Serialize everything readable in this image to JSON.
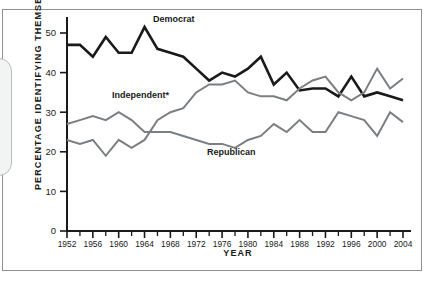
{
  "figure": {
    "ylabel": "PERCENTAGE IDENTIFYING THEMSELVES AS . . .",
    "xlabel": "YEAR"
  },
  "labels": {
    "democrat": "Democrat",
    "independent": "Independent*",
    "republican": "Republican"
  },
  "colors": {
    "democrat": "#1a1a1a",
    "independent": "#7b7f82",
    "republican": "#7b7f82",
    "axis": "#1a1a1a",
    "frame": "#8e9295"
  },
  "chart_data": {
    "type": "line",
    "title": "",
    "xlabel": "YEAR",
    "ylabel": "PERCENTAGE IDENTIFYING THEMSELVES AS . . .",
    "xlim": [
      1952,
      2004
    ],
    "ylim": [
      0,
      53
    ],
    "grid": false,
    "legend": "inline-labels",
    "x": [
      1952,
      1954,
      1956,
      1958,
      1960,
      1962,
      1964,
      1966,
      1968,
      1970,
      1972,
      1974,
      1976,
      1978,
      1980,
      1982,
      1984,
      1986,
      1988,
      1990,
      1992,
      1994,
      1996,
      1998,
      2000,
      2002,
      2004
    ],
    "xticks_major": [
      1952,
      1956,
      1960,
      1964,
      1968,
      1972,
      1976,
      1980,
      1984,
      1988,
      1992,
      1996,
      2000,
      2004
    ],
    "xticks_minor": [
      1954,
      1958,
      1962,
      1966,
      1970,
      1974,
      1978,
      1982,
      1986,
      1990,
      1994,
      1998,
      2002
    ],
    "yticks": [
      0,
      10,
      20,
      30,
      40,
      50
    ],
    "series": [
      {
        "name": "Democrat",
        "color": "#1a1a1a",
        "values": [
          47,
          47,
          44,
          49,
          45,
          45,
          51.5,
          46,
          45,
          44,
          41,
          38,
          40,
          39,
          41,
          44,
          37,
          40,
          35.5,
          36,
          36,
          34,
          39,
          34,
          35,
          34,
          33
        ]
      },
      {
        "name": "Independent*",
        "color": "#7b7f82",
        "values": [
          23,
          22,
          23,
          19,
          23,
          21,
          23,
          28,
          30,
          31,
          35,
          37,
          37,
          38,
          35,
          34,
          34,
          33,
          36,
          38,
          39,
          35,
          33,
          35,
          41,
          36,
          38.5
        ]
      },
      {
        "name": "Republican",
        "color": "#7b7f82",
        "values": [
          27,
          28,
          29,
          28,
          30,
          28,
          25,
          25,
          25,
          24,
          23,
          22,
          22,
          21,
          23,
          24,
          27,
          25,
          28,
          25,
          25,
          30,
          29,
          28,
          24,
          30,
          27.5
        ]
      }
    ],
    "annotations": [
      {
        "text": "Democrat",
        "x": 1966,
        "y": 52
      },
      {
        "text": "Independent*",
        "x": 1963,
        "y": 35
      },
      {
        "text": "Republican",
        "x": 1982,
        "y": 21
      }
    ]
  }
}
